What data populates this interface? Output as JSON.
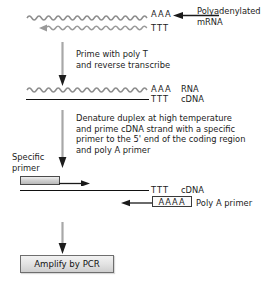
{
  "diagram": {
    "stages": [
      {
        "id": "stage-mrna",
        "top_strand_seq": "AAA",
        "bottom_strand_seq": "TTT",
        "callout": "Polyadenylated\nmRNA",
        "callout_line1": "Polyadenylated",
        "callout_line2": "mRNA"
      },
      {
        "id": "stage-rna-cdna",
        "top_strand_seq": "AAA",
        "top_strand_label": "RNA",
        "bottom_strand_seq": "TTT",
        "bottom_strand_label": "cDNA"
      },
      {
        "id": "stage-primed-cdna",
        "specific_primer_label_line1": "Specific",
        "specific_primer_label_line2": "primer",
        "strand_seq": "TTT",
        "strand_label": "cDNA",
        "polya_primer_seq": "AAAA",
        "polya_primer_label": "Poly A primer"
      }
    ],
    "steps": [
      {
        "id": "step-prime-rt",
        "lines": [
          "Prime with poly T",
          "and reverse transcribe"
        ]
      },
      {
        "id": "step-denature",
        "lines": [
          "Denature duplex at high temperature",
          "and prime cDNA strand with a specific",
          "primer to the 5' end of the coding region",
          "and poly A primer"
        ]
      }
    ],
    "result": {
      "id": "result-pcr",
      "label": "Amplify by PCR"
    },
    "colors": {
      "strand_dark": "#111111",
      "rna_wave": "#8a8a8a",
      "arrow_gray": "#a8a8a8",
      "arrow_dark": "#1a1a1a",
      "primer_fill": "#d2d2d2",
      "pcr_fill": "#e3e3e3",
      "text": "#1c1c1c"
    }
  }
}
